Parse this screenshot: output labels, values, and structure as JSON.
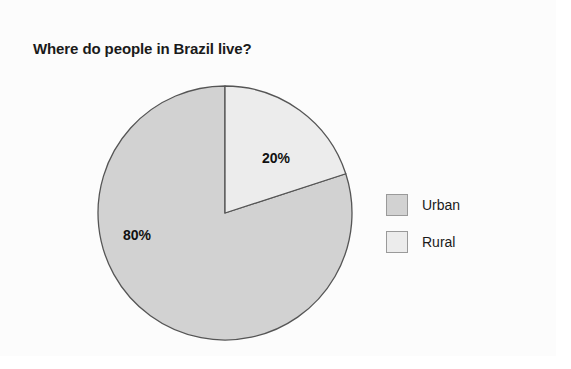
{
  "chart_data": {
    "type": "pie",
    "title": "Where do people in Brazil live?",
    "categories": [
      "Urban",
      "Rural"
    ],
    "values": [
      80,
      20
    ],
    "data_labels": [
      "80%",
      "20%"
    ],
    "start_angle_deg": 0,
    "direction": "clockwise",
    "legend_position": "right",
    "grid": false,
    "xlabel": "",
    "ylabel": "",
    "slices": [
      {
        "label": "Urban",
        "value": 80,
        "data_label": "80%",
        "color": "#d2d2d2",
        "start_deg": 72,
        "end_deg": 360
      },
      {
        "label": "Rural",
        "value": 20,
        "data_label": "20%",
        "color": "#ececec",
        "start_deg": 0,
        "end_deg": 72
      }
    ]
  },
  "title": {
    "text": "Where do people in Brazil live?"
  },
  "pie": {
    "center_x": 137,
    "center_y": 138,
    "radius": 127,
    "stroke_color": "#555555",
    "labels": {
      "urban": "80%",
      "rural": "20%"
    }
  },
  "legend": {
    "items": [
      {
        "label": "Urban",
        "color": "#d2d2d2"
      },
      {
        "label": "Rural",
        "color": "#ececec"
      }
    ]
  },
  "colors": {
    "background": "#ffffff",
    "panel": "#fcfcfc",
    "urban_fill": "#d2d2d2",
    "rural_fill": "#ececec",
    "slice_stroke": "#555555",
    "legend_border": "#9a9a9a",
    "text": "#1a1a1a"
  }
}
